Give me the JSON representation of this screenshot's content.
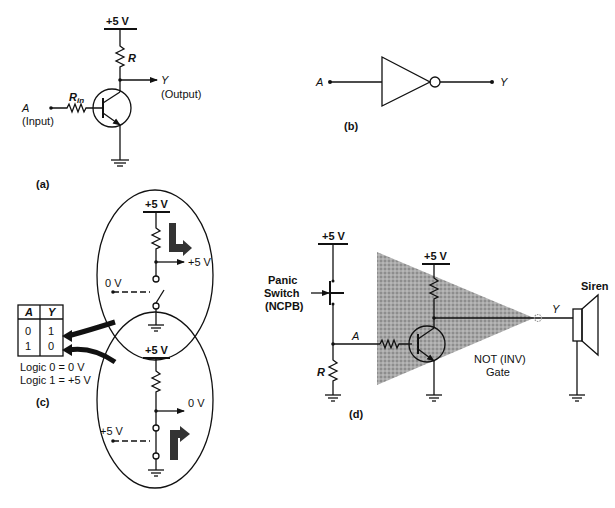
{
  "colors": {
    "ink": "#111111",
    "shade": "#8a8a8a",
    "background": "#ffffff"
  },
  "panel_a": {
    "caption": "(a)",
    "supply": "+5 V",
    "resistor": "R",
    "input_resistor": "R",
    "input_resistor_sub": "in",
    "input_label": "A",
    "input_desc": "(Input)",
    "output_label": "Y",
    "output_desc": "(Output)"
  },
  "panel_b": {
    "caption": "(b)",
    "input_label": "A",
    "output_label": "Y"
  },
  "panel_c": {
    "caption": "(c)",
    "truth_table": {
      "headers": [
        "A",
        "Y"
      ],
      "rows": [
        [
          "0",
          "1"
        ],
        [
          "1",
          "0"
        ]
      ]
    },
    "logic_def_0": "Logic 0 = 0 V",
    "logic_def_1": "Logic 1 = +5 V",
    "top_circle": {
      "supply": "+5 V",
      "input": "0 V",
      "output": "+5 V"
    },
    "bottom_circle": {
      "supply": "+5 V",
      "input": "+5 V",
      "output": "0 V"
    }
  },
  "panel_d": {
    "caption": "(d)",
    "switch_supply": "+5 V",
    "switch_label_1": "Panic",
    "switch_label_2": "Switch",
    "switch_label_3": "(NCPB)",
    "node_label": "A",
    "pulldown_resistor": "R",
    "gate_supply": "+5 V",
    "output_label": "Y",
    "gate_name_1": "NOT (INV)",
    "gate_name_2": "Gate",
    "siren_label": "Siren"
  }
}
